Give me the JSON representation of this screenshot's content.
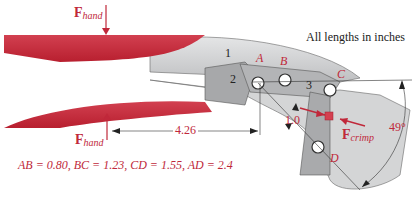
{
  "note": "All lengths in inches",
  "forces": {
    "hand_top": {
      "symbol": "F",
      "subscript": "hand"
    },
    "hand_bottom": {
      "symbol": "F",
      "subscript": "hand"
    },
    "crimp": {
      "symbol": "F",
      "subscript": "crimp"
    }
  },
  "points": {
    "A": "A",
    "B": "B",
    "C": "C",
    "D": "D"
  },
  "links": {
    "l1": "1",
    "l2": "2",
    "l3": "3"
  },
  "dimensions": {
    "handle_length": "4.26",
    "offset": "1.0",
    "angle": "49°"
  },
  "equation": "AB = 0.80, BC = 1.23, CD = 1.55, AD = 2.4",
  "colors": {
    "handle_red": "#c8283a",
    "metal_gray": "#c9cacb",
    "label_red": "#c0283a"
  }
}
